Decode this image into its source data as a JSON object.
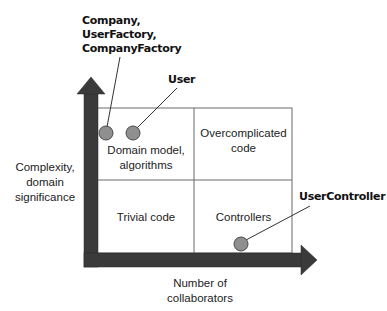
{
  "diagram": {
    "quadrants": {
      "top_left": "Domain model, algorithms",
      "top_left_line1": "Domain model,",
      "top_left_line2": "algorithms",
      "top_right_line1": "Overcomplicated",
      "top_right_line2": "code",
      "bottom_left": "Trivial code",
      "bottom_right": "Controllers"
    },
    "axes": {
      "y_label_line1": "Complexity,",
      "y_label_line2": "domain",
      "y_label_line3": "significance",
      "x_label_line1": "Number of",
      "x_label_line2": "collaborators"
    },
    "callouts": [
      {
        "lines": [
          "Company,",
          "UserFactory,",
          "CompanyFactory"
        ]
      },
      {
        "lines": [
          "User"
        ]
      },
      {
        "lines": [
          "UserController"
        ]
      }
    ],
    "colors": {
      "axis": "#3a3a3a",
      "grid": "#6b6b6b",
      "point_fill": "#8f8f8f",
      "point_stroke": "#4a4a4a"
    }
  }
}
